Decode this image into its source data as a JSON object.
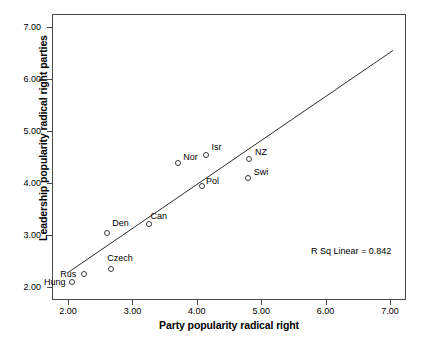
{
  "chart_data": {
    "type": "scatter",
    "title": "",
    "xlabel": "Party popularity radical right",
    "ylabel": "Leadership popularity radical right parties",
    "xlim": [
      1.75,
      7.25
    ],
    "ylim": [
      1.75,
      7.25
    ],
    "xticks": [
      "2.00",
      "3.00",
      "4.00",
      "5.00",
      "6.00",
      "7.00"
    ],
    "xtick_values": [
      2.0,
      3.0,
      4.0,
      5.0,
      6.0,
      7.0
    ],
    "yticks": [
      "2.00",
      "3.00",
      "4.00",
      "5.00",
      "6.00",
      "7.00"
    ],
    "ytick_values": [
      2.0,
      3.0,
      4.0,
      5.0,
      6.0,
      7.0
    ],
    "grid": false,
    "legend": false,
    "points": [
      {
        "label": "Hung",
        "x": 2.06,
        "y": 2.1,
        "label_dx": -28,
        "label_dy": -4
      },
      {
        "label": "Rus",
        "x": 2.25,
        "y": 2.25,
        "label_dx": -24,
        "label_dy": -4
      },
      {
        "label": "Czech",
        "x": 2.67,
        "y": 2.35,
        "label_dx": -4,
        "label_dy": -15
      },
      {
        "label": "Den",
        "x": 2.61,
        "y": 3.03,
        "label_dx": 5,
        "label_dy": -14
      },
      {
        "label": "Can",
        "x": 3.25,
        "y": 3.22,
        "label_dx": 2,
        "label_dy": -12
      },
      {
        "label": "Nor",
        "x": 3.71,
        "y": 4.38,
        "label_dx": 5,
        "label_dy": -10
      },
      {
        "label": "Isr",
        "x": 4.15,
        "y": 4.53,
        "label_dx": 5,
        "label_dy": -12
      },
      {
        "label": "Pol",
        "x": 4.08,
        "y": 3.94,
        "label_dx": 4,
        "label_dy": -9
      },
      {
        "label": "NZ",
        "x": 4.81,
        "y": 4.46,
        "label_dx": 6,
        "label_dy": -11
      },
      {
        "label": "Swi",
        "x": 4.79,
        "y": 4.09,
        "label_dx": 6,
        "label_dy": -10
      }
    ],
    "fit_line": {
      "x_start": 2.0,
      "y_start": 2.28,
      "x_end": 7.05,
      "y_end": 6.55
    },
    "annotations": [
      {
        "name": "r-squared",
        "text": "R Sq Linear = 0.842"
      }
    ]
  },
  "annotation": {
    "rsq_text": "R Sq Linear = 0.842"
  }
}
